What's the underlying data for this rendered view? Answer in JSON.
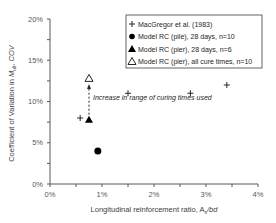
{
  "chart_data": {
    "type": "scatter",
    "title": "",
    "xlabel": "Longitudinal reinforcement ratio, A_s/bd",
    "xlabel_parts": {
      "pre": "Longitudinal reinforcement ratio, A",
      "sub": "s",
      "post": "/bd"
    },
    "ylabel": "Coefficient of Variation in M_ult, COV",
    "ylabel_parts": {
      "pre": "Coefficient of Variation in ",
      "main": "M",
      "sub": "ult",
      "post": ", COV"
    },
    "xlim": [
      0,
      4
    ],
    "ylim": [
      0,
      20
    ],
    "x_ticks": [
      "0%",
      "1%",
      "2%",
      "3%",
      "4%"
    ],
    "y_ticks": [
      "0%",
      "5%",
      "10%",
      "15%",
      "20%"
    ],
    "grid": false,
    "legend_position": "upper right",
    "series": [
      {
        "name": "MacGregor et al. (1983)",
        "marker": "plus",
        "points": [
          [
            0.58,
            8.0
          ],
          [
            1.5,
            11.0
          ],
          [
            2.7,
            11.0
          ],
          [
            3.4,
            12.0
          ]
        ]
      },
      {
        "name": "Model RC (pile), 28 days, n=10",
        "marker": "filled-circle",
        "points": [
          [
            0.92,
            4.0
          ]
        ]
      },
      {
        "name": "Model RC (pier), 28 days, n=6",
        "marker": "filled-triangle",
        "points": [
          [
            0.75,
            7.8
          ]
        ]
      },
      {
        "name": "Model RC (pier), all cure times, n=10",
        "marker": "open-triangle",
        "points": [
          [
            0.75,
            12.8
          ]
        ]
      }
    ],
    "annotations": [
      {
        "text": "Increase in range of curing times used",
        "style": "italic",
        "arrow": {
          "from": [
            0.75,
            8.4
          ],
          "to": [
            0.75,
            12.0
          ],
          "style": "dashed"
        }
      }
    ]
  }
}
